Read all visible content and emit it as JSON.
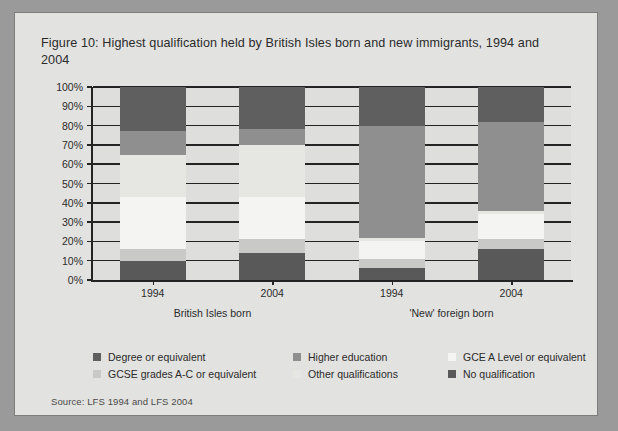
{
  "figure": {
    "title": "Figure 10: Highest qualification held by British Isles born and new immigrants, 1994 and 2004",
    "source": "Source: LFS 1994 and LFS 2004"
  },
  "chart_data": {
    "type": "bar",
    "stacked": true,
    "title": "Figure 10: Highest qualification held by British Isles born and new immigrants, 1994 and 2004",
    "xlabel": "",
    "ylabel": "",
    "ylim": [
      0,
      100
    ],
    "yticks": [
      "0%",
      "10%",
      "20%",
      "30%",
      "40%",
      "50%",
      "60%",
      "70%",
      "80%",
      "90%",
      "100%"
    ],
    "grid": true,
    "legend_position": "bottom",
    "categories": [
      "1994",
      "2004",
      "1994",
      "2004"
    ],
    "groups": [
      {
        "label": "British Isles born",
        "categories": [
          "1994",
          "2004"
        ]
      },
      {
        "label": "'New' foreign born",
        "categories": [
          "1994",
          "2004"
        ]
      }
    ],
    "series": [
      {
        "name": "No qualification",
        "color": "#595959",
        "values": [
          10,
          14,
          6,
          16
        ]
      },
      {
        "name": "GCSE grades A-C or equivalent",
        "color": "#c9c9c7",
        "values": [
          6,
          7,
          5,
          5
        ]
      },
      {
        "name": "GCE A Level or equivalent",
        "color": "#f4f4f2",
        "values": [
          27,
          22,
          9,
          13
        ]
      },
      {
        "name": "Other qualifications",
        "color": "#e6e6e3",
        "values": [
          22,
          27,
          2,
          2
        ]
      },
      {
        "name": "Higher education",
        "color": "#8f8f8f",
        "values": [
          12,
          8,
          58,
          46
        ]
      },
      {
        "name": "Degree or equivalent",
        "color": "#5f5f5f",
        "values": [
          23,
          22,
          20,
          18
        ]
      }
    ],
    "legend": [
      {
        "label": "Degree or equivalent",
        "color": "#5f5f5f"
      },
      {
        "label": "Higher education",
        "color": "#8f8f8f"
      },
      {
        "label": "GCE A Level or equivalent",
        "color": "#f4f4f2"
      },
      {
        "label": "GCSE grades A-C or equivalent",
        "color": "#c9c9c7"
      },
      {
        "label": "Other qualifications",
        "color": "#e6e6e3"
      },
      {
        "label": "No qualification",
        "color": "#595959"
      }
    ]
  }
}
